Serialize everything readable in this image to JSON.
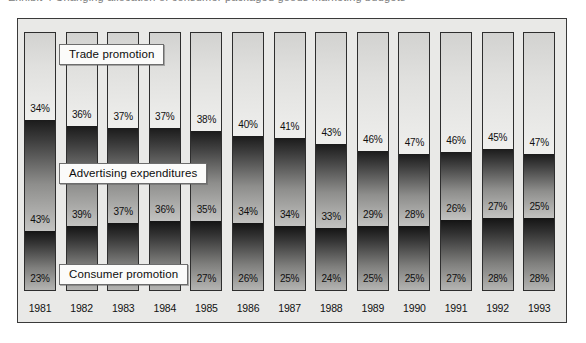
{
  "caption": {
    "text": "Exhibit 4  Changing allocation of consumer packaged goods marketing budgets"
  },
  "chart_data": {
    "type": "bar",
    "stacked": true,
    "normalized_percent": true,
    "title": "",
    "xlabel": "",
    "ylabel": "",
    "ylim": [
      0,
      100
    ],
    "grid": false,
    "legend_position": "inline-callouts",
    "categories": [
      "1981",
      "1982",
      "1983",
      "1984",
      "1985",
      "1986",
      "1987",
      "1988",
      "1989",
      "1990",
      "1991",
      "1992",
      "1993"
    ],
    "series": [
      {
        "name": "Trade promotion",
        "order": "top",
        "color": "#e0e0de",
        "values": [
          34,
          36,
          37,
          37,
          38,
          40,
          41,
          43,
          46,
          47,
          46,
          45,
          47
        ],
        "labels": [
          "34%",
          "36%",
          "37%",
          "37%",
          "38%",
          "40%",
          "41%",
          "43%",
          "46%",
          "47%",
          "46%",
          "45%",
          "47%"
        ]
      },
      {
        "name": "Advertising expenditures",
        "order": "middle",
        "color": "#3d3d3d",
        "values": [
          43,
          39,
          37,
          36,
          35,
          34,
          34,
          33,
          29,
          28,
          26,
          27,
          25
        ],
        "labels": [
          "43%",
          "39%",
          "37%",
          "36%",
          "35%",
          "34%",
          "34%",
          "33%",
          "29%",
          "28%",
          "26%",
          "27%",
          "25%"
        ]
      },
      {
        "name": "Consumer promotion",
        "order": "bottom",
        "color": "#333333",
        "values": [
          23,
          25,
          26,
          27,
          27,
          26,
          25,
          24,
          25,
          25,
          27,
          28,
          28
        ],
        "labels": [
          "23%",
          "25%",
          "26%",
          "27%",
          "27%",
          "26%",
          "25%",
          "24%",
          "25%",
          "25%",
          "27%",
          "28%",
          "28%"
        ]
      }
    ],
    "callouts": [
      {
        "id": "trade",
        "label": "Trade promotion"
      },
      {
        "id": "adv",
        "label": "Advertising expenditures"
      },
      {
        "id": "cons",
        "label": "Consumer promotion"
      }
    ]
  },
  "colors": {
    "plot_background": "#e9e9e7",
    "frame_border": "#3a3a3a",
    "bar_border": "#2e2e2e",
    "callout_background": "#fbfbfa",
    "callout_border": "#6d6d6d",
    "page_background": "#ffffff"
  }
}
